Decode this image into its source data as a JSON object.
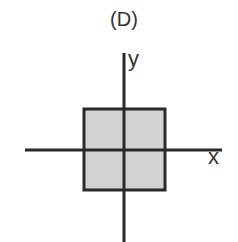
{
  "figure": {
    "title": "(D)",
    "axes": {
      "x_label": "x",
      "y_label": "y"
    },
    "shape": {
      "type": "square",
      "centered_at_origin": true,
      "fill": "#d2d2d2",
      "stroke": "#2a2a2a"
    }
  }
}
